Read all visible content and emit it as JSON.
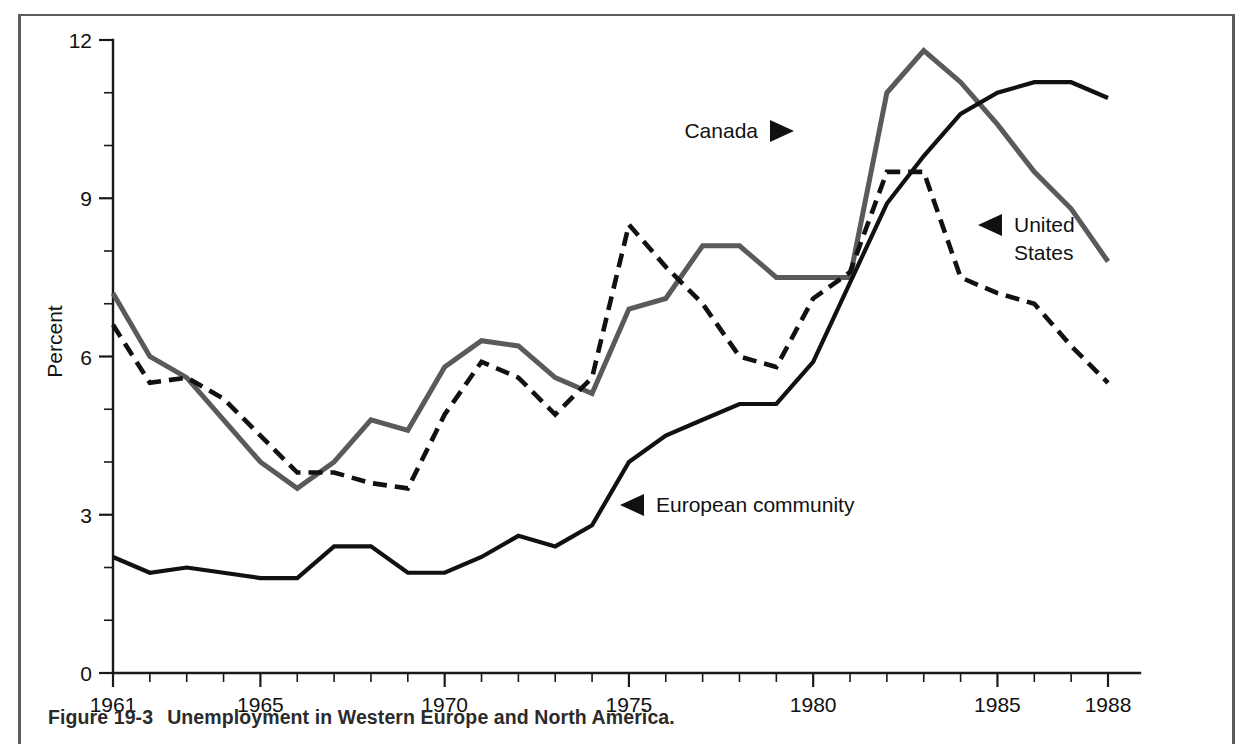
{
  "figure": {
    "caption_number": "Figure 19-3",
    "caption_text": "Unemployment in Western Europe and North America."
  },
  "chart_data": {
    "type": "line",
    "title": "",
    "xlabel": "",
    "ylabel": "Percent",
    "xlim": [
      1961,
      1988
    ],
    "ylim": [
      0,
      12
    ],
    "grid": false,
    "legend_position": "inline-annotations",
    "x_tick_labels": [
      "1961",
      "1965",
      "1970",
      "1975",
      "1980",
      "1985",
      "1988"
    ],
    "x_tick_values": [
      1961,
      1965,
      1970,
      1975,
      1980,
      1985,
      1988
    ],
    "x_minor_ticks": [
      1962,
      1963,
      1964,
      1966,
      1967,
      1968,
      1969,
      1971,
      1972,
      1973,
      1974,
      1976,
      1977,
      1978,
      1979,
      1981,
      1982,
      1983,
      1984,
      1986,
      1987
    ],
    "y_tick_labels": [
      "0",
      "3",
      "6",
      "9",
      "12"
    ],
    "y_tick_values": [
      0,
      3,
      6,
      9,
      12
    ],
    "y_minor_ticks": [
      1,
      2,
      4,
      5,
      7,
      8,
      10,
      11
    ],
    "x": [
      1961,
      1962,
      1963,
      1964,
      1965,
      1966,
      1967,
      1968,
      1969,
      1970,
      1971,
      1972,
      1973,
      1974,
      1975,
      1976,
      1977,
      1978,
      1979,
      1980,
      1981,
      1982,
      1983,
      1984,
      1985,
      1986,
      1987,
      1988
    ],
    "series": [
      {
        "name": "Canada",
        "style": "solid",
        "color": "#5a5a5a",
        "width": 5.0,
        "values": [
          7.2,
          6.0,
          5.6,
          4.8,
          4.0,
          3.5,
          4.0,
          4.8,
          4.6,
          5.8,
          6.3,
          6.2,
          5.6,
          5.3,
          6.9,
          7.1,
          8.1,
          8.1,
          7.5,
          7.5,
          7.5,
          11.0,
          11.8,
          11.2,
          10.4,
          9.5,
          8.8,
          7.8
        ]
      },
      {
        "name": "United States",
        "style": "dashed",
        "color": "#111111",
        "width": 4.6,
        "values": [
          6.6,
          5.5,
          5.6,
          5.2,
          4.5,
          3.8,
          3.8,
          3.6,
          3.5,
          4.9,
          5.9,
          5.6,
          4.9,
          5.6,
          8.5,
          7.7,
          7.0,
          6.0,
          5.8,
          7.1,
          7.6,
          9.5,
          9.5,
          7.5,
          7.2,
          7.0,
          6.2,
          5.5
        ]
      },
      {
        "name": "European community",
        "style": "solid",
        "color": "#111111",
        "width": 4.2,
        "values": [
          2.2,
          1.9,
          2.0,
          1.9,
          1.8,
          1.8,
          2.4,
          2.4,
          1.9,
          1.9,
          2.2,
          2.6,
          2.4,
          2.8,
          4.0,
          4.5,
          4.8,
          5.1,
          5.1,
          5.9,
          7.4,
          8.9,
          9.8,
          10.6,
          11.0,
          11.2,
          11.2,
          10.9
        ]
      }
    ],
    "annotations": [
      {
        "id": "canada",
        "label": "Canada",
        "arrow": "right",
        "x": 758,
        "y": 131
      },
      {
        "id": "united-states",
        "label_line1": "United",
        "label_line2": "States",
        "arrow": "left",
        "x": 978,
        "y": 225
      },
      {
        "id": "european-community",
        "label": "European community",
        "arrow": "left",
        "x": 620,
        "y": 505
      }
    ]
  }
}
